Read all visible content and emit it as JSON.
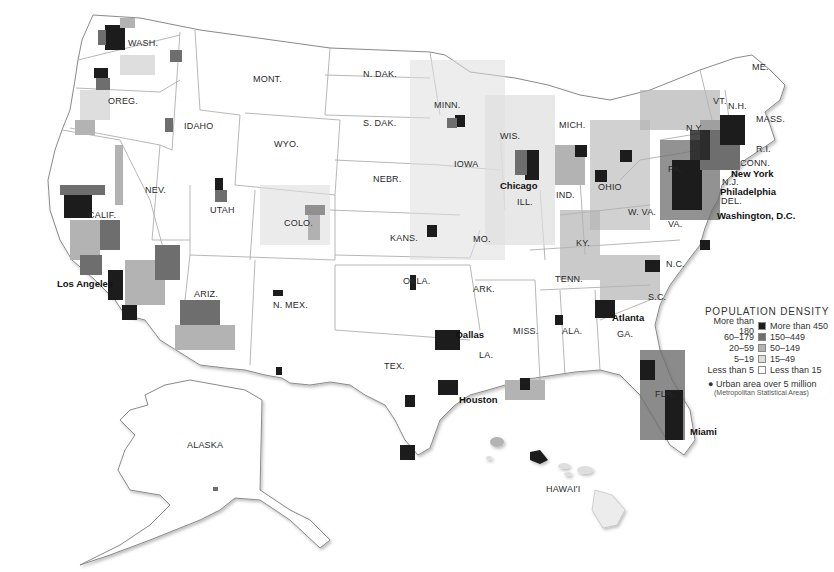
{
  "map": {
    "title": "POPULATION DENSITY",
    "colors": {
      "darkest": "#1c1c1c",
      "dark": "#6e6e6e",
      "medium": "#b3b3b3",
      "light": "#dedede",
      "lightest": "#f8f8f8",
      "border": "#9a9a9a"
    },
    "legend": {
      "title": "POPULATION DENSITY",
      "rows": [
        {
          "left": "More than 180",
          "right": "More than 450",
          "color": "#1c1c1c"
        },
        {
          "left": "60–179",
          "right": "150–449",
          "color": "#6e6e6e"
        },
        {
          "left": "20–59",
          "right": "50–149",
          "color": "#b3b3b3"
        },
        {
          "left": "5–19",
          "right": "15–49",
          "color": "#dedede"
        },
        {
          "left": "Less than 5",
          "right": "Less than 15",
          "color": "#ffffff"
        }
      ],
      "note": "Urban area over 5 million",
      "note_sub": "(Metropolitan Statistical Areas)"
    },
    "state_labels": [
      {
        "text": "WASH.",
        "x": 128,
        "y": 44
      },
      {
        "text": "OREG.",
        "x": 108,
        "y": 102
      },
      {
        "text": "IDAHO",
        "x": 184,
        "y": 127
      },
      {
        "text": "MONT.",
        "x": 253,
        "y": 80
      },
      {
        "text": "N. DAK.",
        "x": 363,
        "y": 75
      },
      {
        "text": "S. DAK.",
        "x": 363,
        "y": 124
      },
      {
        "text": "WYO.",
        "x": 274,
        "y": 145
      },
      {
        "text": "NEBR.",
        "x": 373,
        "y": 180
      },
      {
        "text": "NEV.",
        "x": 145,
        "y": 191
      },
      {
        "text": "UTAH",
        "x": 210,
        "y": 211
      },
      {
        "text": "COLO.",
        "x": 284,
        "y": 224
      },
      {
        "text": "KANS.",
        "x": 390,
        "y": 239
      },
      {
        "text": "CALIF.",
        "x": 88,
        "y": 216
      },
      {
        "text": "ARIZ.",
        "x": 194,
        "y": 295
      },
      {
        "text": "N. MEX.",
        "x": 273,
        "y": 306
      },
      {
        "text": "OKLA.",
        "x": 403,
        "y": 282
      },
      {
        "text": "TEX.",
        "x": 384,
        "y": 367
      },
      {
        "text": "MINN.",
        "x": 434,
        "y": 106
      },
      {
        "text": "IOWA",
        "x": 454,
        "y": 165
      },
      {
        "text": "WIS.",
        "x": 500,
        "y": 137
      },
      {
        "text": "MICH.",
        "x": 559,
        "y": 126
      },
      {
        "text": "ILL.",
        "x": 517,
        "y": 203
      },
      {
        "text": "IND.",
        "x": 556,
        "y": 196
      },
      {
        "text": "OHIO",
        "x": 598,
        "y": 188
      },
      {
        "text": "MO.",
        "x": 473,
        "y": 240
      },
      {
        "text": "KY.",
        "x": 576,
        "y": 244
      },
      {
        "text": "W. VA.",
        "x": 628,
        "y": 213
      },
      {
        "text": "VA.",
        "x": 668,
        "y": 225
      },
      {
        "text": "ARK.",
        "x": 473,
        "y": 290
      },
      {
        "text": "TENN.",
        "x": 555,
        "y": 280
      },
      {
        "text": "N.C.",
        "x": 666,
        "y": 265
      },
      {
        "text": "S.C.",
        "x": 648,
        "y": 298
      },
      {
        "text": "MISS.",
        "x": 513,
        "y": 332
      },
      {
        "text": "ALA.",
        "x": 562,
        "y": 332
      },
      {
        "text": "GA.",
        "x": 617,
        "y": 335
      },
      {
        "text": "LA.",
        "x": 479,
        "y": 356
      },
      {
        "text": "FLA.",
        "x": 655,
        "y": 395
      },
      {
        "text": "PA.",
        "x": 668,
        "y": 170
      },
      {
        "text": "N.Y.",
        "x": 686,
        "y": 129
      },
      {
        "text": "VT.",
        "x": 713,
        "y": 102
      },
      {
        "text": "N.H.",
        "x": 728,
        "y": 107
      },
      {
        "text": "ME.",
        "x": 752,
        "y": 68
      },
      {
        "text": "MASS.",
        "x": 756,
        "y": 120
      },
      {
        "text": "R.I.",
        "x": 756,
        "y": 150
      },
      {
        "text": "CONN.",
        "x": 740,
        "y": 164
      },
      {
        "text": "N.J.",
        "x": 722,
        "y": 183
      },
      {
        "text": "DEL.",
        "x": 721,
        "y": 202
      },
      {
        "text": "ALASKA",
        "x": 187,
        "y": 446
      },
      {
        "text": "HAWAI'I",
        "x": 546,
        "y": 490
      }
    ],
    "city_labels": [
      {
        "text": "Los Angeles",
        "x": 57,
        "y": 284
      },
      {
        "text": "Chicago",
        "x": 500,
        "y": 186
      },
      {
        "text": "New York",
        "x": 731,
        "y": 174
      },
      {
        "text": "Philadelphia",
        "x": 720,
        "y": 192
      },
      {
        "text": "Washington, D.C.",
        "x": 717,
        "y": 216
      },
      {
        "text": "Atlanta",
        "x": 612,
        "y": 318
      },
      {
        "text": "Dallas",
        "x": 456,
        "y": 335
      },
      {
        "text": "Houston",
        "x": 459,
        "y": 400
      },
      {
        "text": "Miami",
        "x": 690,
        "y": 432
      }
    ]
  }
}
